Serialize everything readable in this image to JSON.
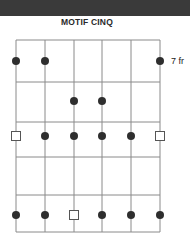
{
  "header": {
    "title": "MOTIF CINQ"
  },
  "fret_label": "7 fr",
  "diagram": {
    "strings": 6,
    "frets_shown": 5,
    "string_x": [
      16,
      45,
      74,
      102,
      131,
      160
    ],
    "fret_y": [
      40,
      82,
      122,
      157,
      195,
      232
    ],
    "colors": {
      "line": "#8a8a8a",
      "dot": "#2e2e2e",
      "root_stroke": "#555555",
      "band": "#3a3a3a"
    },
    "markers": [
      {
        "fret": 1,
        "string": 1,
        "type": "dot"
      },
      {
        "fret": 1,
        "string": 2,
        "type": "dot"
      },
      {
        "fret": 1,
        "string": 6,
        "type": "dot"
      },
      {
        "fret": 2,
        "string": 3,
        "type": "dot"
      },
      {
        "fret": 2,
        "string": 4,
        "type": "dot"
      },
      {
        "fret": 3,
        "string": 1,
        "type": "root"
      },
      {
        "fret": 3,
        "string": 2,
        "type": "dot"
      },
      {
        "fret": 3,
        "string": 3,
        "type": "dot"
      },
      {
        "fret": 3,
        "string": 4,
        "type": "dot"
      },
      {
        "fret": 3,
        "string": 5,
        "type": "dot"
      },
      {
        "fret": 3,
        "string": 6,
        "type": "root"
      },
      {
        "fret": 5,
        "string": 1,
        "type": "dot"
      },
      {
        "fret": 5,
        "string": 2,
        "type": "dot"
      },
      {
        "fret": 5,
        "string": 3,
        "type": "root"
      },
      {
        "fret": 5,
        "string": 4,
        "type": "dot"
      },
      {
        "fret": 5,
        "string": 5,
        "type": "dot"
      },
      {
        "fret": 5,
        "string": 6,
        "type": "dot"
      }
    ]
  }
}
